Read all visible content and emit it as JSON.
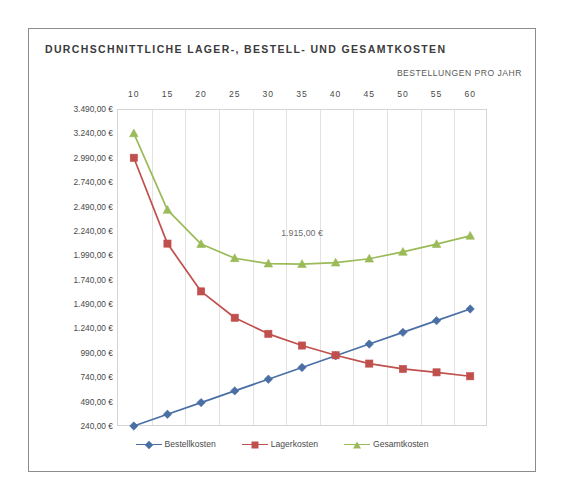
{
  "chart_data": {
    "type": "line",
    "title": "DURCHSCHNITTLICHE LAGER-, BESTELL- UND GESAMTKOSTEN",
    "xlabel": "BESTELLUNGEN PRO JAHR",
    "ylabel": "",
    "categories": [
      "10",
      "15",
      "20",
      "25",
      "30",
      "35",
      "40",
      "45",
      "50",
      "55",
      "60"
    ],
    "x_values": [
      10,
      15,
      20,
      25,
      30,
      35,
      40,
      45,
      50,
      55,
      60
    ],
    "ylim": [
      240,
      3490
    ],
    "ytick_step": 250,
    "ytick_labels": [
      "3.490,00 €",
      "3.240,00 €",
      "2.990,00 €",
      "2.740,00 €",
      "2.490,00 €",
      "2.240,00 €",
      "1.990,00 €",
      "1.740,00 €",
      "1.490,00 €",
      "1.240,00 €",
      "990,00 €",
      "740,00 €",
      "490,00 €",
      "240,00 €"
    ],
    "ytick_values": [
      3490,
      3240,
      2990,
      2740,
      2490,
      2240,
      1990,
      1740,
      1490,
      1240,
      990,
      740,
      490,
      240
    ],
    "grid": "vertical",
    "legend_position": "bottom",
    "annotations": [
      {
        "text": "1.915,00 €",
        "x_category": "35",
        "value": 1915
      }
    ],
    "series": [
      {
        "name": "Bestellkosten",
        "color": "#4a6fa5",
        "marker": "diamond",
        "values": [
          240,
          360,
          480,
          600,
          720,
          840,
          960,
          1080,
          1200,
          1320,
          1440
        ]
      },
      {
        "name": "Lagerkosten",
        "color": "#c0504d",
        "marker": "square",
        "values": [
          2990,
          2110,
          1620,
          1350,
          1185,
          1065,
          965,
          880,
          825,
          790,
          750
        ]
      },
      {
        "name": "Gesamtkosten",
        "color": "#9bbb59",
        "marker": "triangle",
        "values": [
          3240,
          2455,
          2105,
          1960,
          1905,
          1900,
          1915,
          1955,
          2025,
          2105,
          2190
        ]
      }
    ]
  }
}
